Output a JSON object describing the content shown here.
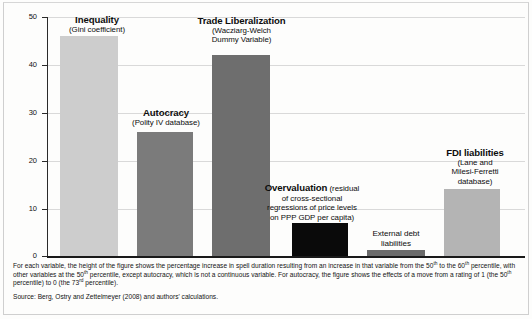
{
  "chart_data": {
    "type": "bar",
    "title": "",
    "xlabel": "",
    "ylabel": "",
    "ylim": [
      0,
      50
    ],
    "yticks": [
      0,
      10,
      20,
      30,
      40,
      50
    ],
    "grid": true,
    "legend": "none",
    "categories": [
      "Inequality",
      "Autocracy",
      "Trade Liberalization",
      "Overvaluation",
      "External debt liabilities",
      "FDI liabilities"
    ],
    "values": [
      46,
      26,
      42,
      7,
      1.3,
      14
    ],
    "bar_colors": [
      "#cdcdcd",
      "#7b7b7b",
      "#6e6e6e",
      "#0a0a0a",
      "#6b6b6b",
      "#b4b4b4"
    ],
    "annotations": [
      {
        "title": "Inequality",
        "subtitle": "(Gini coefficient)",
        "style": "stacked"
      },
      {
        "title": "Autocracy",
        "subtitle": "(Polity IV database)",
        "style": "stacked"
      },
      {
        "title": "Trade Liberalization",
        "subtitle": "(Wacziarg-Welch Dummy Variable)",
        "style": "stacked"
      },
      {
        "title": "Overvaluation",
        "subtitle": "(residual of cross-sectional regressions of price levels on PPP GDP per capita)",
        "style": "inline"
      },
      {
        "title": "",
        "subtitle": "External debt liabilities",
        "style": "plain"
      },
      {
        "title": "FDI liabilities",
        "subtitle": "(Lane and Milesi-Ferretti database)",
        "style": "stacked"
      }
    ]
  },
  "labels": {
    "bar1_title": "Inequality",
    "bar1_sub": "(Gini coefficient)",
    "bar2_title": "Autocracy",
    "bar2_sub": "(Polity IV database)",
    "bar3_title": "Trade Liberalization",
    "bar3_sub_line1": "(Wacziarg-Welch",
    "bar3_sub_line2": "Dummy Variable)",
    "bar4_title": "Overvaluation",
    "bar4_sub_line1": " (residual",
    "bar4_sub_line2": "of cross-sectional",
    "bar4_sub_line3": "regressions of price levels",
    "bar4_sub_line4": "on PPP GDP per capita)",
    "bar5_line1": "External debt",
    "bar5_line2": "liabilities",
    "bar6_title": "FDI liabilities",
    "bar6_sub_line1": "(Lane and",
    "bar6_sub_line2": "Milesi-Ferretti",
    "bar6_sub_line3": "database)"
  },
  "axis": {
    "y_tick_50": "50",
    "y_tick_40": "40",
    "y_tick_30": "30",
    "y_tick_20": "20",
    "y_tick_10": "10",
    "y_tick_0": "0"
  },
  "notes": {
    "line_a": "For each variable, the height of the figure shows the percentage increase in spell duration resulting from an increase in that variable from the 50",
    "sup_a": "th",
    "line_b": " to the 60",
    "sup_b": "th",
    "line_c": " percentile,",
    "line_d": "with other variables at the 50",
    "sup_c": "th",
    "line_e": " percentile, except autocracy, which is not a continuous variable.  For autocracy, the figure shows the effects of a move from a rating of 1",
    "line_f": "(the 50",
    "sup_d": "th",
    "line_g": " percentile) to 0 (the 73",
    "sup_e": "rd",
    "line_h": " percentile).",
    "source": "Source: Berg, Ostry and Zettelmeyer (2008) and authors' calculations."
  }
}
